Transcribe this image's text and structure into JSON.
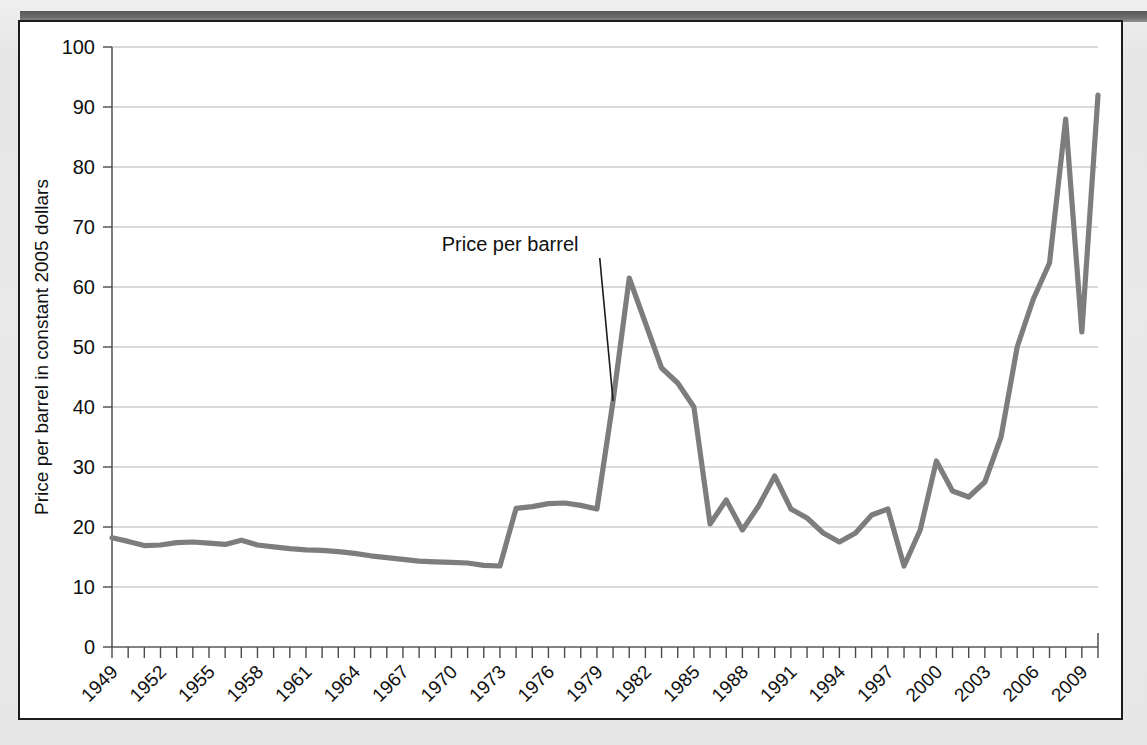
{
  "figure": {
    "frame_color": "#1c1c1c",
    "page_background": "#e9e9e9",
    "card_background": "#ffffff"
  },
  "chart_data": {
    "type": "line",
    "title": "",
    "xlabel": "",
    "ylabel": "Price per barrel in constant 2005 dollars",
    "ylim": [
      0,
      100
    ],
    "ytick_step": 10,
    "yticks": [
      "0",
      "10",
      "20",
      "30",
      "40",
      "50",
      "60",
      "70",
      "80",
      "90",
      "100"
    ],
    "xlim": [
      1949,
      2010
    ],
    "xtick_step": 3,
    "xticks": [
      "1949",
      "1952",
      "1955",
      "1958",
      "1961",
      "1964",
      "1967",
      "1970",
      "1973",
      "1976",
      "1979",
      "1982",
      "1985",
      "1988",
      "1991",
      "1994",
      "1997",
      "2000",
      "2003",
      "2006",
      "2009"
    ],
    "xtick_rotation_deg": 45,
    "grid": "horizontal",
    "legend": "none",
    "line_color": "#7d7d7d",
    "series": [
      {
        "name": "Price per barrel",
        "x": [
          1949,
          1950,
          1951,
          1952,
          1953,
          1954,
          1955,
          1956,
          1957,
          1958,
          1959,
          1960,
          1961,
          1962,
          1963,
          1964,
          1965,
          1966,
          1967,
          1968,
          1969,
          1970,
          1971,
          1972,
          1973,
          1974,
          1975,
          1976,
          1977,
          1978,
          1979,
          1980,
          1981,
          1982,
          1983,
          1984,
          1985,
          1986,
          1987,
          1988,
          1989,
          1990,
          1991,
          1992,
          1993,
          1994,
          1995,
          1996,
          1997,
          1998,
          1999,
          2000,
          2001,
          2002,
          2003,
          2004,
          2005,
          2006,
          2007,
          2008,
          2009,
          2010
        ],
        "values": [
          18.2,
          17.6,
          16.9,
          17.0,
          17.4,
          17.5,
          17.3,
          17.1,
          17.8,
          17.0,
          16.7,
          16.4,
          16.2,
          16.1,
          15.9,
          15.6,
          15.2,
          14.9,
          14.6,
          14.3,
          14.2,
          14.1,
          14.0,
          13.6,
          13.5,
          23.1,
          23.4,
          23.9,
          24.0,
          23.6,
          23.0,
          41.0,
          61.5,
          54.0,
          46.5,
          44.0,
          40.0,
          20.5,
          24.5,
          19.5,
          23.5,
          28.5,
          23.0,
          21.5,
          19.0,
          17.5,
          19.0,
          22.0,
          23.0,
          13.5,
          19.5,
          31.0,
          26.0,
          25.0,
          27.5,
          35.0,
          50.0,
          58.0,
          64.0,
          88.0,
          52.5,
          92.0
        ]
      }
    ],
    "annotations": [
      {
        "label": "Price per barrel",
        "text_x": 1969.4,
        "text_y": 66.0,
        "point_x": 1980.0,
        "point_y": 41.0
      }
    ]
  }
}
